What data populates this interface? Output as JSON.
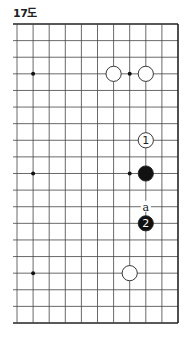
{
  "diagram": {
    "title": "17도",
    "board": {
      "columns_x": [
        17,
        33.1,
        49.2,
        65.3,
        81.4,
        97.5,
        113.6,
        129.7,
        145.8,
        161.9,
        178
      ],
      "rows_y_start": 24,
      "row_spacing": 16.611,
      "row_count": 19,
      "left_stub_x": 13,
      "right_edge": true,
      "top_edge": true,
      "bottom_edge": true,
      "line_color": "#444444",
      "edge_color": "#222222"
    },
    "star_points": [
      {
        "col": 1,
        "row": 3
      },
      {
        "col": 7,
        "row": 3
      },
      {
        "col": 1,
        "row": 9
      },
      {
        "col": 7,
        "row": 9
      },
      {
        "col": 1,
        "row": 15
      }
    ],
    "stones": [
      {
        "color": "white",
        "col": 6,
        "row": 3,
        "label": ""
      },
      {
        "color": "white",
        "col": 8,
        "row": 3,
        "label": ""
      },
      {
        "color": "white",
        "col": 8,
        "row": 7,
        "label": "1"
      },
      {
        "color": "black",
        "col": 8,
        "row": 9,
        "label": ""
      },
      {
        "color": "black",
        "col": 8,
        "row": 12,
        "label": "2"
      },
      {
        "color": "white",
        "col": 7,
        "row": 15,
        "label": ""
      }
    ],
    "markers": [
      {
        "col": 8,
        "row": 11,
        "label": "a"
      }
    ]
  }
}
